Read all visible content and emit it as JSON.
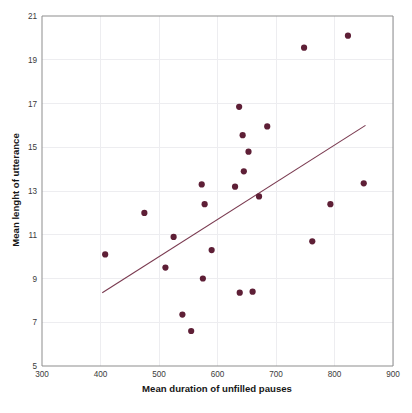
{
  "chart_data": {
    "type": "scatter",
    "title": "",
    "xlabel": "Mean duration of unfilled pauses",
    "ylabel": "Mean lenght of utterance",
    "xlim": [
      300,
      900
    ],
    "ylim": [
      5,
      21
    ],
    "xticks": [
      300,
      400,
      500,
      600,
      700,
      800,
      900
    ],
    "yticks": [
      5,
      7,
      9,
      11,
      13,
      15,
      17,
      19,
      21
    ],
    "grid": true,
    "legend": "none",
    "point_color": "#5e1f36",
    "trendline_color": "#7a3a50",
    "grid_color": "#ededf0",
    "axis_color": "#8d8d8d",
    "points": [
      {
        "x": 408,
        "y": 10.1
      },
      {
        "x": 475,
        "y": 12.0
      },
      {
        "x": 511,
        "y": 9.5
      },
      {
        "x": 525,
        "y": 10.9
      },
      {
        "x": 540,
        "y": 7.35
      },
      {
        "x": 555,
        "y": 6.6
      },
      {
        "x": 573,
        "y": 13.3
      },
      {
        "x": 575,
        "y": 9.0
      },
      {
        "x": 578,
        "y": 12.4
      },
      {
        "x": 590,
        "y": 10.3
      },
      {
        "x": 630,
        "y": 13.2
      },
      {
        "x": 637,
        "y": 16.85
      },
      {
        "x": 638,
        "y": 8.35
      },
      {
        "x": 643,
        "y": 15.55
      },
      {
        "x": 645,
        "y": 13.9
      },
      {
        "x": 660,
        "y": 8.4
      },
      {
        "x": 653,
        "y": 14.8
      },
      {
        "x": 671,
        "y": 12.75
      },
      {
        "x": 685,
        "y": 15.95
      },
      {
        "x": 748,
        "y": 19.55
      },
      {
        "x": 762,
        "y": 10.7
      },
      {
        "x": 793,
        "y": 12.4
      },
      {
        "x": 823,
        "y": 20.1
      },
      {
        "x": 850,
        "y": 13.35
      }
    ],
    "trendline": {
      "x0": 403,
      "y0": 8.35,
      "x1": 853,
      "y1": 16.0
    }
  },
  "caption": {
    "text": ""
  }
}
